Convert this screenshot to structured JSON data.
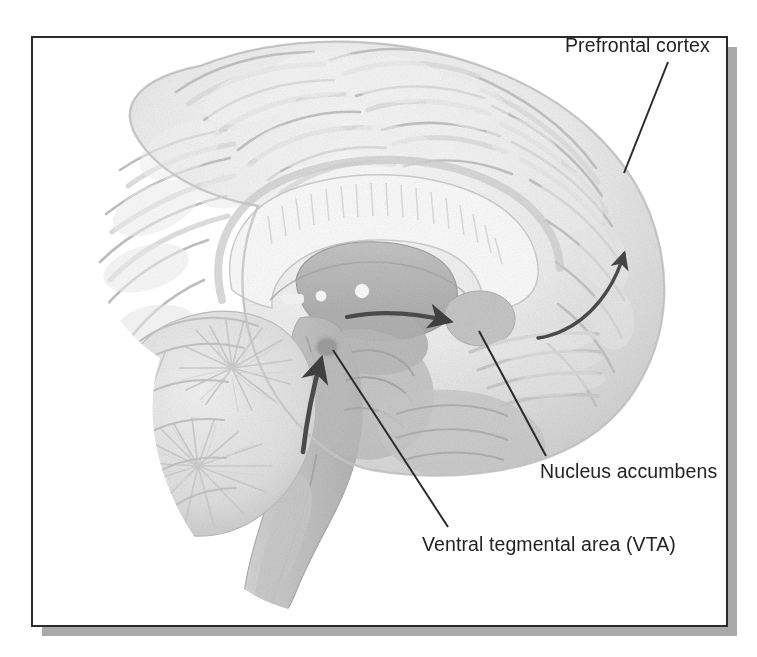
{
  "figure": {
    "view": "mid-sagittal section",
    "style": "grayscale stipple / pencil medical illustration",
    "frame": {
      "border_color": "#2b2b2b",
      "border_width_px": 2,
      "fill_color": "#ffffff",
      "shadow_color": "#a9a9a9",
      "x": 32,
      "y": 37,
      "width": 695,
      "height": 589
    },
    "background_color": "#ffffff"
  },
  "palette": {
    "ink": "#232323",
    "leader_line": "#2a2a2a",
    "arrow": "#4a4a4a",
    "cortex_light": "#f1f1f1",
    "cortex_mid": "#e2e2e2",
    "cortex_shade": "#cfcfcf",
    "cortex_deep": "#bdbdbd",
    "white_matter": "#fafafa",
    "deep_gray": "#b9b9b9",
    "deep_gray_dark": "#a6a6a6",
    "brainstem": "#c6c6c6",
    "cerebellum": "#e6e6e6",
    "vta_spot": "#9a9a9a",
    "accumbens": "#c2c2c2"
  },
  "labels": [
    {
      "id": "prefrontal-cortex",
      "text": "Prefrontal cortex",
      "anchor": "start",
      "text_x": 565,
      "text_y": 52,
      "leader": {
        "x1": 668,
        "y1": 62,
        "x2": 624,
        "y2": 173
      }
    },
    {
      "id": "nucleus-accumbens",
      "text": "Nucleus accumbens",
      "anchor": "start",
      "text_x": 540,
      "text_y": 478,
      "leader": {
        "x1": 479,
        "y1": 331,
        "x2": 546,
        "y2": 456
      }
    },
    {
      "id": "ventral-tegmental-area",
      "text": "Ventral tegmental area (VTA)",
      "anchor": "start",
      "text_x": 422,
      "text_y": 551,
      "leader": {
        "x1": 333,
        "y1": 350,
        "x2": 448,
        "y2": 527
      }
    }
  ],
  "pathway_arrows": [
    {
      "id": "vta-input-arrow",
      "description": "thick upward arrow pointing into the ventral tegmental area",
      "direction": "up",
      "from": {
        "x": 310,
        "y": 440
      },
      "to": {
        "x": 322,
        "y": 357
      }
    },
    {
      "id": "vta-to-accumbens-arrow",
      "description": "arrow from VTA forward to the nucleus accumbens",
      "direction": "right",
      "from": {
        "x": 349,
        "y": 318
      },
      "to": {
        "x": 456,
        "y": 324
      }
    },
    {
      "id": "accumbens-to-prefrontal-arrow",
      "description": "curved arrow from nucleus accumbens up to the prefrontal cortex",
      "direction": "up-curve",
      "from": {
        "x": 540,
        "y": 330
      },
      "to": {
        "x": 629,
        "y": 216
      }
    }
  ],
  "anatomy_regions": [
    {
      "id": "cerebral-cortex",
      "name": "Cerebral cortex"
    },
    {
      "id": "corpus-callosum",
      "name": "Corpus callosum"
    },
    {
      "id": "thalamus",
      "name": "Thalamus"
    },
    {
      "id": "cerebellum",
      "name": "Cerebellum"
    },
    {
      "id": "brainstem",
      "name": "Brainstem"
    },
    {
      "id": "spinal-cord",
      "name": "Spinal cord"
    },
    {
      "id": "vta-region",
      "name": "Ventral tegmental area"
    },
    {
      "id": "accumbens-region",
      "name": "Nucleus accumbens"
    }
  ]
}
